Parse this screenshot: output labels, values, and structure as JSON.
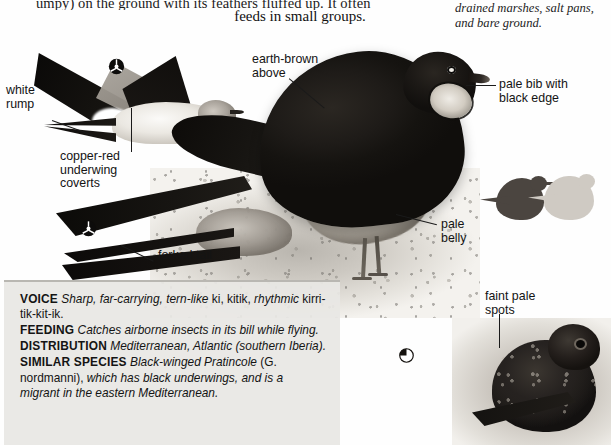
{
  "page": {
    "top_text_clipped": "umpy) on the ground with its feathers fluffed up. It often",
    "top_text_line2": "feeds in small groups.",
    "right_caption": "drained marshes, salt pans, and bare ground."
  },
  "annotations": [
    {
      "name": "white-rump",
      "text": "white\nrump"
    },
    {
      "name": "copper-red-underwing",
      "text": "copper-red\nunderwing\ncoverts"
    },
    {
      "name": "forked-tail",
      "text": "forked tail"
    },
    {
      "name": "earth-brown-above",
      "text": "earth-brown\nabove"
    },
    {
      "name": "pale-bib",
      "text": "pale bib with\nblack edge"
    },
    {
      "name": "pale-belly",
      "text": "pale\nbelly"
    },
    {
      "name": "faint-pale-spots",
      "text": "faint pale\nspots"
    }
  ],
  "factbox": {
    "voice": {
      "key": "VOICE",
      "italic_1": "Sharp, far-carrying, tern-like",
      "roman_1": "ki, kitik,",
      "italic_2": "rhythmic",
      "roman_2": "kirri-tik-kit-ik."
    },
    "feeding": {
      "key": "FEEDING",
      "italic_1": "Catches airborne insects in its bill while flying."
    },
    "distribution": {
      "key": "DISTRIBUTION",
      "italic_1": "Mediterranean, Atlantic (southern Iberia)."
    },
    "similar_species": {
      "key": "SIMILAR SPECIES",
      "italic_1": "Black-winged Pratincole",
      "roman_1": "(G. nordmanni),",
      "italic_2": "which has black underwings, and is a migrant in the eastern Mediterranean."
    }
  },
  "icons": {
    "scale_indicator": "three-spoke-circle-icon",
    "pie_indicator": "pie-quarter-icon"
  },
  "colors": {
    "ink": "#141414",
    "factbox_bg": "#e8e7e4",
    "factbox_rule": "#b9b7b2",
    "paper": "#fefefe"
  }
}
